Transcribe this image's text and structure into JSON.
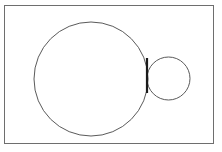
{
  "figure": {
    "width": 222,
    "height": 152,
    "background_color": "#ffffff"
  },
  "frame": {
    "name": "outer-rectangle-border",
    "x": 4.5,
    "y": 5.5,
    "width": 209,
    "height": 138,
    "stroke_color": "#6e6e6e",
    "stroke_width": 1,
    "fill_color": "#ffffff"
  },
  "shapes": {
    "large_circle": {
      "label": "large circle",
      "cx": 91,
      "cy": 79,
      "r": 57,
      "stroke_color": "#5a5a5a",
      "stroke_width": 1,
      "fill_color": "none"
    },
    "small_circle": {
      "label": "small circle",
      "cx": 168.5,
      "cy": 78.5,
      "r": 21.5,
      "stroke_color": "#5a5a5a",
      "stroke_width": 1,
      "fill_color": "none"
    },
    "tangent_bar": {
      "label": "vertical tangent segment",
      "x": 147,
      "y1": 58,
      "y2": 93,
      "stroke_color": "#1a1a1a",
      "stroke_width": 2.2
    }
  },
  "annotations": {
    "caption": ""
  }
}
